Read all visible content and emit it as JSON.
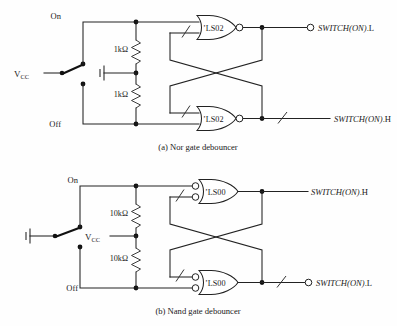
{
  "figure": {
    "background_color": "#fefefe",
    "line_color": "#222222"
  },
  "panels": [
    {
      "id": "panel-a",
      "caption": "(a)  Nor gate debouncer",
      "supply_label": "V",
      "supply_sub": "CC",
      "supply_position": "switch-common",
      "ground_position": "resistor-midpoint",
      "switch": {
        "throw_on_label": "On",
        "throw_off_label": "Off",
        "type": "spdt"
      },
      "resistors": [
        {
          "value": "1kΩ",
          "position": "upper"
        },
        {
          "value": "1kΩ",
          "position": "lower"
        }
      ],
      "gates": [
        {
          "label": "’LS02",
          "type": "nor",
          "shape": "or-body-output-bubble",
          "position": "upper"
        },
        {
          "label": "’LS02",
          "type": "nor",
          "shape": "or-body-output-bubble",
          "position": "lower"
        }
      ],
      "outputs": [
        {
          "name": "SWITCH(ON)",
          "suffix": ".L",
          "bubble": true,
          "slash": false,
          "position": "upper"
        },
        {
          "name": "SWITCH(ON)",
          "suffix": ".H",
          "bubble": false,
          "slash": true,
          "position": "lower"
        }
      ]
    },
    {
      "id": "panel-b",
      "caption": "(b)  Nand gate debouncer",
      "supply_label": "V",
      "supply_sub": "CC",
      "supply_position": "resistor-midpoint",
      "ground_position": "switch-common",
      "switch": {
        "throw_on_label": "On",
        "throw_off_label": "Off",
        "type": "spdt"
      },
      "resistors": [
        {
          "value": "10kΩ",
          "position": "upper"
        },
        {
          "value": "10kΩ",
          "position": "lower"
        }
      ],
      "gates": [
        {
          "label": "’LS00",
          "type": "nand",
          "shape": "or-body-input-bubbles",
          "position": "upper"
        },
        {
          "label": "’LS00",
          "type": "nand",
          "shape": "or-body-input-bubbles",
          "position": "lower"
        }
      ],
      "outputs": [
        {
          "name": "SWITCH(ON)",
          "suffix": ".H",
          "bubble": false,
          "slash": false,
          "position": "upper"
        },
        {
          "name": "SWITCH(ON)",
          "suffix": ".L",
          "bubble": true,
          "slash": true,
          "position": "lower"
        }
      ]
    }
  ]
}
